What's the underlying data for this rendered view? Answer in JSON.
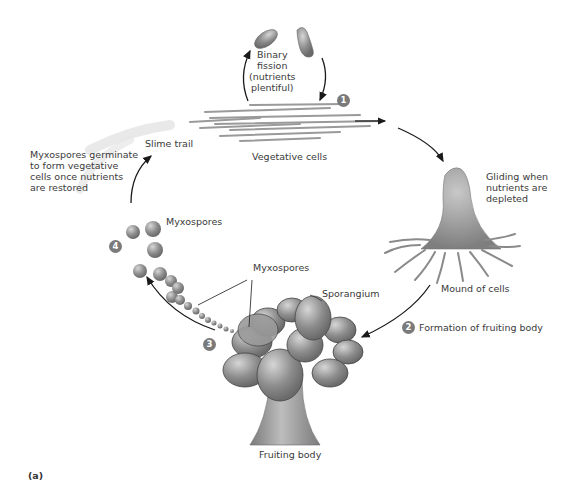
{
  "figure": {
    "panel_label": "(a)",
    "steps": [
      {
        "number": "1",
        "label": ""
      },
      {
        "number": "2",
        "label": "Formation of fruiting body"
      },
      {
        "number": "3",
        "label": ""
      },
      {
        "number": "4",
        "label": ""
      }
    ],
    "labels": {
      "binary_fission": "Binary\nfission\n(nutrients\nplentiful)",
      "vegetative_cells": "Vegetative cells",
      "slime_trail": "Slime trail",
      "germinate": "Myxospores germinate\nto form vegetative\ncells once nutrients\nare restored",
      "gliding": "Gliding when\nnutrients are\ndepleted",
      "mound": "Mound of cells",
      "myxospores_top": "Myxospores",
      "myxospores_mid": "Myxospores",
      "sporangium": "Sporangium",
      "fruiting_body": "Fruiting body"
    },
    "colors": {
      "badge": "#7a7a7a",
      "cell_gray": "#9a9a9a",
      "arrow": "#1a1a1a",
      "text": "#3a3a3a"
    }
  }
}
